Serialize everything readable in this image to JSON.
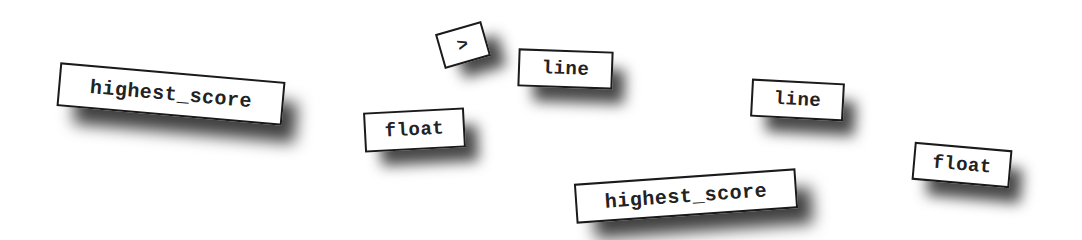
{
  "tiles": [
    {
      "id": "highest-score-left",
      "label": "highest_score"
    },
    {
      "id": "greater-than",
      "label": ">"
    },
    {
      "id": "line-top",
      "label": "line"
    },
    {
      "id": "float-left",
      "label": "float"
    },
    {
      "id": "line-right",
      "label": "line"
    },
    {
      "id": "highest-score-bottom",
      "label": "highest_score"
    },
    {
      "id": "float-right",
      "label": "float"
    }
  ],
  "colors": {
    "background": "#ffffff",
    "tile_border": "#1a1a1a",
    "tile_text": "#222222",
    "shadow": "#000000"
  }
}
